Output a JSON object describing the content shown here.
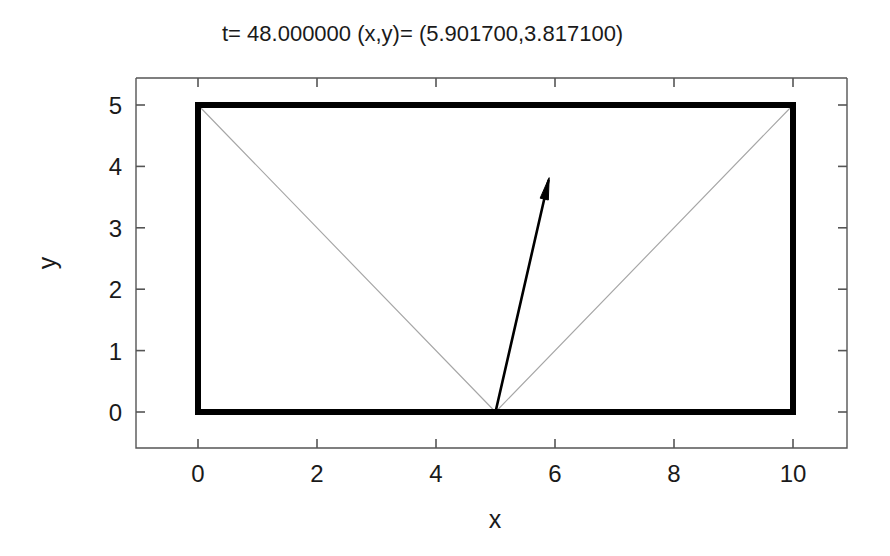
{
  "title": {
    "text": "t= 48.000000 (x,y)= (5.901700,3.817100)",
    "time_label": "t=",
    "time_value": "48.000000",
    "coord_label": "(x,y)=",
    "coord_value": "(5.901700,3.817100)"
  },
  "axes": {
    "x_title": "x",
    "y_title": "y",
    "x_ticks": [
      "0",
      "2",
      "4",
      "6",
      "8",
      "10"
    ],
    "y_ticks": [
      "0",
      "1",
      "2",
      "3",
      "4",
      "5"
    ],
    "x_range": [
      -1.0,
      11.0
    ],
    "y_range": [
      -0.88,
      5.72
    ],
    "grid": false,
    "legend": "none"
  },
  "chart_data": {
    "type": "line",
    "title": "t= 48.000000 (x,y)= (5.901700,3.817100)",
    "xlabel": "x",
    "ylabel": "y",
    "xlim": [
      -1.0,
      11.0
    ],
    "ylim": [
      -0.88,
      5.72
    ],
    "x_ticks": [
      0,
      2,
      4,
      6,
      8,
      10
    ],
    "y_ticks": [
      0,
      1,
      2,
      3,
      4,
      5
    ],
    "grid": false,
    "legend_position": "none",
    "series": [
      {
        "name": "box-boundary",
        "type": "rectangle",
        "color": "#000000",
        "linewidth": 6,
        "x0": 0,
        "y0": 0,
        "x1": 10,
        "y1": 5
      },
      {
        "name": "trajectory",
        "type": "billiard-path",
        "color": "#a6a6a6",
        "linewidth": 1.15,
        "start": [
          5.0,
          0.0
        ],
        "direction": [
          -0.965,
          0.965
        ],
        "total_time": 48.0,
        "speed": 1.365,
        "box": [
          0,
          0,
          10,
          5
        ]
      },
      {
        "name": "velocity-arrow",
        "type": "arrow",
        "color": "#000000",
        "linewidth": 2.6,
        "tail": [
          5.0,
          0.0
        ],
        "tip": [
          5.9017,
          3.8171
        ]
      }
    ]
  },
  "geometry": {
    "plot_left_px": 136,
    "plot_right_px": 847,
    "plot_top_px": 78,
    "plot_bottom_px": 448,
    "x0_px": 198,
    "x10_px": 793,
    "y0_px": 412,
    "y5_px": 105
  }
}
